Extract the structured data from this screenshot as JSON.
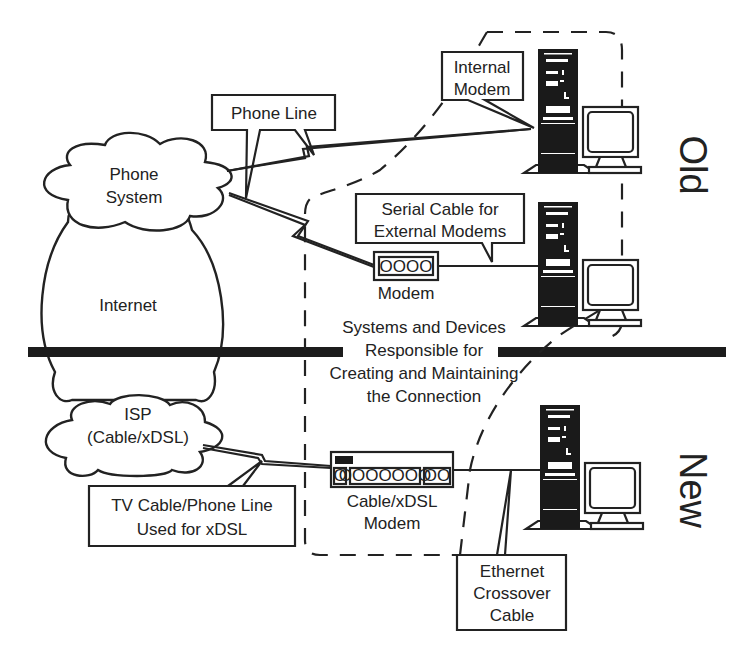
{
  "clouds": {
    "phone_system": [
      "Phone",
      "System"
    ],
    "internet": "Internet",
    "isp": [
      "ISP",
      "(Cable/xDSL)"
    ]
  },
  "callouts": {
    "phone_line": "Phone Line",
    "internal_modem": [
      "Internal",
      "Modem"
    ],
    "serial_cable": [
      "Serial Cable for",
      "External Modems"
    ],
    "tv_cable": [
      "TV Cable/Phone Line",
      "Used for xDSL"
    ],
    "ethernet": [
      "Ethernet",
      "Crossover",
      "Cable"
    ]
  },
  "devices": {
    "external_modem_label": "Modem",
    "external_modem_glyph": "OOOO",
    "cable_modem_label": [
      "Cable/xDSL",
      "Modem"
    ],
    "cable_modem_ports": [
      "O",
      "OOOOOOO",
      "OO"
    ]
  },
  "region_label": [
    "Systems and Devices",
    "Responsible for",
    "Creating and Maintaining",
    "the Connection"
  ],
  "eras": {
    "old": "Old",
    "new": "New"
  },
  "colors": {
    "ink": "#222222",
    "background": "#ffffff",
    "divider": "#1c1c1c"
  }
}
